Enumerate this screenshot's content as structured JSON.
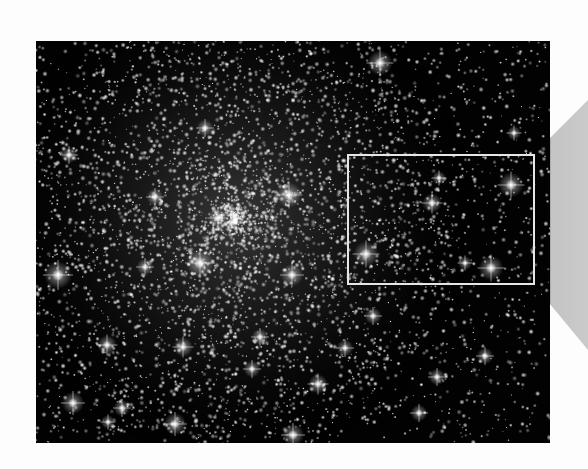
{
  "image": {
    "subject": "globular star cluster",
    "frame": {
      "x": 36,
      "y": 41,
      "width": 514,
      "height": 402
    },
    "background_color": "#020202",
    "page_color": "#fdfdfd",
    "cluster_center": {
      "x": 235,
      "y": 220
    },
    "cluster_core_radius": 150
  },
  "inset_box": {
    "x": 347,
    "y": 154,
    "width": 188,
    "height": 131,
    "border_color": "#e6e6e6"
  },
  "zoom_cone": {
    "inner": {
      "x": 535,
      "top": 153,
      "bottom": 286
    },
    "outer": {
      "x": 588,
      "top": 100,
      "bottom": 350
    },
    "near_color": "#6e6e6e",
    "far_color": "#cacaca"
  },
  "bright_stars": [
    {
      "x": 380,
      "y": 63,
      "r": 9
    },
    {
      "x": 58,
      "y": 275,
      "r": 10
    },
    {
      "x": 200,
      "y": 263,
      "r": 10
    },
    {
      "x": 289,
      "y": 195,
      "r": 9
    },
    {
      "x": 292,
      "y": 275,
      "r": 8
    },
    {
      "x": 218,
      "y": 218,
      "r": 7
    },
    {
      "x": 366,
      "y": 254,
      "r": 9
    },
    {
      "x": 432,
      "y": 203,
      "r": 7
    },
    {
      "x": 511,
      "y": 185,
      "r": 9
    },
    {
      "x": 491,
      "y": 268,
      "r": 9
    },
    {
      "x": 73,
      "y": 403,
      "r": 8
    },
    {
      "x": 175,
      "y": 424,
      "r": 8
    },
    {
      "x": 293,
      "y": 435,
      "r": 8
    },
    {
      "x": 318,
      "y": 384,
      "r": 7
    },
    {
      "x": 183,
      "y": 347,
      "r": 7
    },
    {
      "x": 107,
      "y": 345,
      "r": 7
    },
    {
      "x": 122,
      "y": 408,
      "r": 6
    },
    {
      "x": 419,
      "y": 413,
      "r": 6
    },
    {
      "x": 485,
      "y": 356,
      "r": 6
    },
    {
      "x": 437,
      "y": 377,
      "r": 6
    },
    {
      "x": 69,
      "y": 155,
      "r": 6
    },
    {
      "x": 155,
      "y": 197,
      "r": 6
    },
    {
      "x": 205,
      "y": 128,
      "r": 6
    },
    {
      "x": 373,
      "y": 316,
      "r": 6
    },
    {
      "x": 345,
      "y": 348,
      "r": 6
    },
    {
      "x": 252,
      "y": 369,
      "r": 6
    },
    {
      "x": 260,
      "y": 337,
      "r": 6
    },
    {
      "x": 145,
      "y": 267,
      "r": 6
    },
    {
      "x": 439,
      "y": 178,
      "r": 5
    },
    {
      "x": 465,
      "y": 263,
      "r": 5
    },
    {
      "x": 514,
      "y": 133,
      "r": 5
    },
    {
      "x": 108,
      "y": 422,
      "r": 5
    }
  ],
  "faint_star_count": 5200,
  "seed": 12345
}
